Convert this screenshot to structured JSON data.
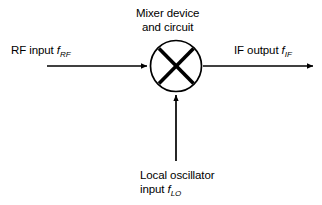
{
  "diagram": {
    "background_color": "#ffffff",
    "stroke_color": "#000000",
    "text_color": "#000000",
    "mixer": {
      "title_line1": "Mixer device",
      "title_line2": "and circuit",
      "symbol": "circle-with-x",
      "center_x": 176,
      "center_y": 66,
      "radius": 26
    },
    "ports": {
      "rf_input": {
        "label_text": "RF input",
        "symbol_var": "f",
        "symbol_sub": "RF",
        "direction": "into-mixer",
        "side": "left"
      },
      "if_output": {
        "label_text": "IF output",
        "symbol_var": "f",
        "symbol_sub": "IF",
        "direction": "out-of-mixer",
        "side": "right"
      },
      "lo_input": {
        "label_line1": "Local oscillator",
        "label_line2_text": "input",
        "symbol_var": "f",
        "symbol_sub": "LO",
        "direction": "into-mixer",
        "side": "bottom"
      }
    }
  }
}
